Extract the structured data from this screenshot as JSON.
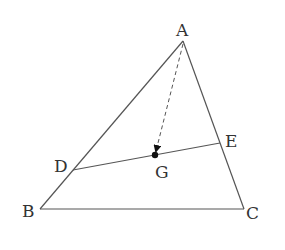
{
  "diagram": {
    "type": "geometry-triangle",
    "colors": {
      "line": "#555555",
      "label": "#333333",
      "point": "#111111"
    },
    "points": {
      "A": {
        "label": "A",
        "x": 183,
        "y": 41
      },
      "B": {
        "label": "B",
        "x": 40,
        "y": 209
      },
      "C": {
        "label": "C",
        "x": 244,
        "y": 209
      },
      "D": {
        "label": "D",
        "x": 73,
        "y": 170
      },
      "E": {
        "label": "E",
        "x": 220,
        "y": 143
      },
      "G": {
        "label": "G",
        "x": 155,
        "y": 155
      }
    },
    "segments": [
      {
        "from": "A",
        "to": "B",
        "style": "solid"
      },
      {
        "from": "A",
        "to": "C",
        "style": "solid"
      },
      {
        "from": "B",
        "to": "C",
        "style": "solid"
      },
      {
        "from": "D",
        "to": "E",
        "style": "solid"
      },
      {
        "from": "A",
        "to": "G",
        "style": "dashed-arrow"
      }
    ]
  }
}
